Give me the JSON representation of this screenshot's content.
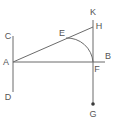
{
  "diagram": {
    "canvas": {
      "width": 118,
      "height": 126
    },
    "colors": {
      "background": "#ffffff",
      "stroke": "#6b6b6b",
      "label": "#555555",
      "point_fill": "#3a3a3a"
    },
    "labels": {
      "c": "C",
      "a": "A",
      "d": "D",
      "e": "E",
      "k": "K",
      "h": "H",
      "b": "B",
      "f": "F",
      "g": "G"
    },
    "points": [
      {
        "id": "C",
        "label": "C",
        "x": 13,
        "y": 36
      },
      {
        "id": "A",
        "label": "A",
        "x": 13,
        "y": 62
      },
      {
        "id": "D",
        "label": "D",
        "x": 13,
        "y": 92
      },
      {
        "id": "E",
        "label": "E",
        "x": 64,
        "y": 40
      },
      {
        "id": "K",
        "label": "K",
        "x": 93,
        "y": 19
      },
      {
        "id": "H",
        "label": "H",
        "x": 93,
        "y": 27
      },
      {
        "id": "B",
        "label": "B",
        "x": 105,
        "y": 62
      },
      {
        "id": "F",
        "label": "F",
        "x": 93,
        "y": 62
      },
      {
        "id": "G",
        "label": "G",
        "x": 93,
        "y": 105
      }
    ],
    "segments": [
      {
        "id": "CD",
        "from": "C",
        "to": "D",
        "x1": 13,
        "y1": 36,
        "x2": 13,
        "y2": 92
      },
      {
        "id": "AB",
        "from": "A",
        "to": "B",
        "x1": 13,
        "y1": 62,
        "x2": 105,
        "y2": 62
      },
      {
        "id": "AH",
        "from": "A",
        "to": "H",
        "x1": 13,
        "y1": 62,
        "x2": 93,
        "y2": 27
      },
      {
        "id": "KG",
        "from": "K",
        "to": "G",
        "x1": 93,
        "y1": 20,
        "x2": 93,
        "y2": 105
      }
    ],
    "arc": {
      "id": "arc-EF",
      "center": "F",
      "from": "E",
      "to": "F",
      "path": "M 66 38 A 26 26 0 0 1 93 62"
    },
    "marked_point": {
      "id": "G-dot",
      "x": 93,
      "y": 104,
      "r": 1.8
    }
  }
}
